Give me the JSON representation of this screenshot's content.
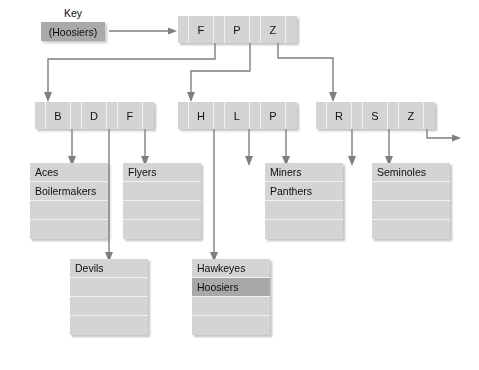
{
  "figure": {
    "type": "b-plus-tree-index-diagram",
    "accent_cell_color": "#d4d4d4",
    "highlight_color": "#a8a8a8",
    "key_box_color": "#a9a9a9",
    "wire_color": "#7f7f7f"
  },
  "key_lookup": {
    "label": "Key",
    "value": "(Hoosiers)"
  },
  "root_node": {
    "name": "root",
    "keys": [
      "F",
      "P",
      "Z"
    ],
    "cells": [
      "",
      "F",
      "",
      "P",
      "",
      "Z",
      ""
    ]
  },
  "internal_nodes": [
    {
      "name": "left",
      "keys": [
        "B",
        "D",
        "F"
      ],
      "cells": [
        "",
        "B",
        "",
        "D",
        "",
        "F",
        ""
      ]
    },
    {
      "name": "middle",
      "keys": [
        "H",
        "L",
        "P"
      ],
      "cells": [
        "",
        "H",
        "",
        "L",
        "",
        "P",
        ""
      ]
    },
    {
      "name": "right",
      "keys": [
        "R",
        "S",
        "Z"
      ],
      "cells": [
        "",
        "R",
        "",
        "S",
        "",
        "Z",
        ""
      ]
    }
  ],
  "leaf_nodes": [
    {
      "name": "leaf-aces",
      "rows": [
        {
          "text": "Aces",
          "highlight": false
        },
        {
          "text": "Boilermakers",
          "highlight": false
        },
        {
          "text": "",
          "highlight": false
        },
        {
          "text": "",
          "highlight": false
        }
      ]
    },
    {
      "name": "leaf-flyers",
      "rows": [
        {
          "text": "Flyers",
          "highlight": false
        },
        {
          "text": "",
          "highlight": false
        },
        {
          "text": "",
          "highlight": false
        },
        {
          "text": "",
          "highlight": false
        }
      ]
    },
    {
      "name": "leaf-miners",
      "rows": [
        {
          "text": "Miners",
          "highlight": false
        },
        {
          "text": "Panthers",
          "highlight": false
        },
        {
          "text": "",
          "highlight": false
        },
        {
          "text": "",
          "highlight": false
        }
      ]
    },
    {
      "name": "leaf-seminoles",
      "rows": [
        {
          "text": "Seminoles",
          "highlight": false
        },
        {
          "text": "",
          "highlight": false
        },
        {
          "text": "",
          "highlight": false
        },
        {
          "text": "",
          "highlight": false
        }
      ]
    },
    {
      "name": "leaf-devils",
      "rows": [
        {
          "text": "Devils",
          "highlight": false
        },
        {
          "text": "",
          "highlight": false
        },
        {
          "text": "",
          "highlight": false
        },
        {
          "text": "",
          "highlight": false
        }
      ]
    },
    {
      "name": "leaf-hawkeyes",
      "rows": [
        {
          "text": "Hawkeyes",
          "highlight": false
        },
        {
          "text": "Hoosiers",
          "highlight": true
        },
        {
          "text": "",
          "highlight": false
        },
        {
          "text": "",
          "highlight": false
        }
      ]
    }
  ]
}
